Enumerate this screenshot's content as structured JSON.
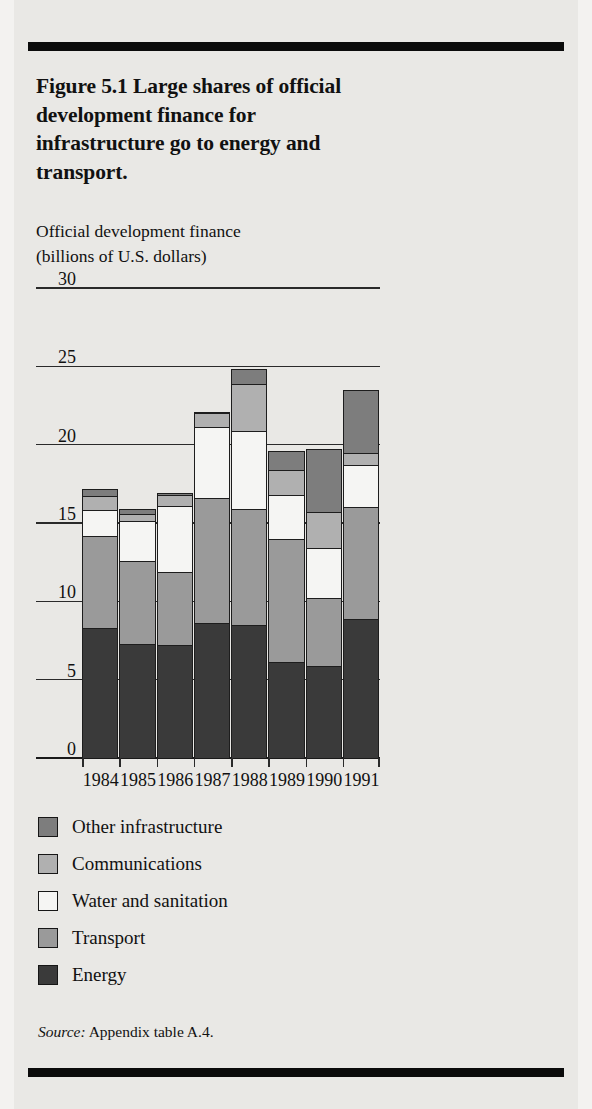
{
  "figure": {
    "title": "Figure 5.1  Large shares of official development finance for infrastructure go to energy and transport.",
    "axis_caption_line1": "Official development finance",
    "axis_caption_line2": "(billions of U.S. dollars)",
    "source_word": "Source:",
    "source_text": " Appendix table A.4."
  },
  "colors": {
    "energy": "#3a3a3a",
    "transport": "#9a9a9a",
    "water": "#f5f5f3",
    "communications": "#b0b0b0",
    "other": "#7d7d7d",
    "outline": "#1d1d1d",
    "paper": "#e9e8e5",
    "rule": "#0b0b0b"
  },
  "chart_data": {
    "type": "bar",
    "subtype": "stacked",
    "title": "Figure 5.1  Large shares of official development finance for infrastructure go to energy and transport.",
    "xlabel": "",
    "ylabel": "Official development finance (billions of U.S. dollars)",
    "ylim": [
      0,
      30
    ],
    "yticks": [
      0,
      5,
      10,
      15,
      20,
      25,
      30
    ],
    "ytick_labels": [
      "0",
      "5",
      "10",
      "15",
      "20",
      "25",
      "30"
    ],
    "grid": true,
    "legend_position": "below-plot",
    "categories": [
      "1984",
      "1985",
      "1986",
      "1987",
      "1988",
      "1989",
      "1990",
      "1991"
    ],
    "stack_order_bottom_to_top": [
      "Energy",
      "Transport",
      "Water and sanitation",
      "Communications",
      "Other infrastructure"
    ],
    "series": [
      {
        "name": "Energy",
        "values": [
          8.3,
          7.3,
          7.2,
          8.6,
          8.5,
          6.1,
          5.9,
          8.9
        ]
      },
      {
        "name": "Transport",
        "values": [
          5.9,
          5.3,
          4.7,
          8.0,
          7.4,
          7.9,
          4.3,
          7.1
        ]
      },
      {
        "name": "Water and sanitation",
        "values": [
          1.6,
          2.5,
          4.2,
          4.5,
          5.0,
          2.8,
          3.2,
          2.7
        ]
      },
      {
        "name": "Communications",
        "values": [
          0.9,
          0.5,
          0.7,
          0.9,
          3.0,
          1.6,
          2.3,
          0.8
        ]
      },
      {
        "name": "Other infrastructure",
        "values": [
          0.5,
          0.3,
          0.1,
          0.1,
          0.9,
          1.2,
          4.0,
          4.0
        ]
      }
    ],
    "totals": [
      17.2,
      15.9,
      16.9,
      22.1,
      24.8,
      19.6,
      19.7,
      23.5
    ],
    "legend_entries": [
      "Other infrastructure",
      "Communications",
      "Water and sanitation",
      "Transport",
      "Energy"
    ]
  }
}
